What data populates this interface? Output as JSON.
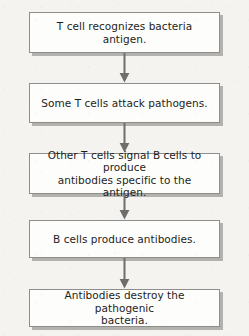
{
  "diagram": {
    "background_color": "#f4f3f0",
    "box_fill_color": "#fdfdfc",
    "box_border_color": "#8d8d8b",
    "box_shadow_color": "#b4b2ae",
    "text_color": "#1d1d1b",
    "arrow_color": "#6e6e6c",
    "nodes": [
      {
        "id": "node-1",
        "label": "T cell recognizes bacteria antigen."
      },
      {
        "id": "node-2",
        "label": "Some T cells attack pathogens."
      },
      {
        "id": "node-3",
        "label": "Other T cells signal B cells to produce\nantibodies specific to the antigen."
      },
      {
        "id": "node-4",
        "label": "B cells produce antibodies."
      },
      {
        "id": "node-5",
        "label": "Antibodies destroy the pathogenic\nbacteria."
      }
    ],
    "connectors": [
      {
        "id": "connector-1",
        "icon": "arrow-down-icon",
        "from": "node-1",
        "to": "node-2"
      },
      {
        "id": "connector-2",
        "icon": "arrow-down-icon",
        "from": "node-2",
        "to": "node-3"
      },
      {
        "id": "connector-3",
        "icon": "arrow-down-icon",
        "from": "node-3",
        "to": "node-4"
      },
      {
        "id": "connector-4",
        "icon": "arrow-down-icon",
        "from": "node-4",
        "to": "node-5"
      }
    ]
  }
}
